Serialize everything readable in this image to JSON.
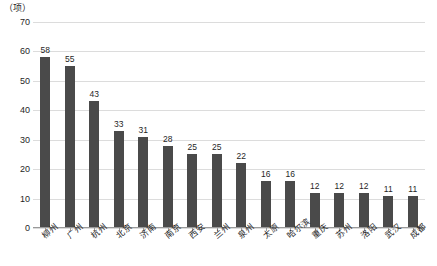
{
  "chart_data": {
    "type": "bar",
    "title": "",
    "subtitle": "",
    "xlabel": "",
    "ylabel": "（项）",
    "unit_label": "（项）",
    "ylim": [
      0,
      70
    ],
    "ytick_values": [
      0,
      10,
      20,
      30,
      40,
      50,
      60,
      70
    ],
    "ytick_labels": [
      "0",
      "10",
      "20",
      "30",
      "40",
      "50",
      "60",
      "70"
    ],
    "grid": true,
    "grid_axis": "y",
    "legend": null,
    "legend_position": "none",
    "bar_color": "#4a4a4a",
    "grid_color": "#dcdcdc",
    "axis_color": "#9a9a9a",
    "categories": [
      "柳州",
      "广州",
      "杭州",
      "北京",
      "济南",
      "南京",
      "西安",
      "兰州",
      "泉州",
      "太原",
      "哈尔滨",
      "重庆",
      "苏州",
      "洛阳",
      "武汉",
      "成都"
    ],
    "values": [
      58,
      55,
      43,
      33,
      31,
      28,
      25,
      25,
      22,
      16,
      16,
      12,
      12,
      12,
      11,
      11
    ],
    "value_labels": [
      "58",
      "55",
      "43",
      "33",
      "31",
      "28",
      "25",
      "25",
      "22",
      "16",
      "16",
      "12",
      "12",
      "12",
      "11",
      "11"
    ]
  }
}
